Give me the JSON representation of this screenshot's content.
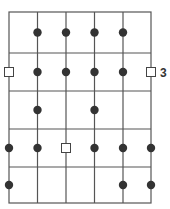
{
  "diagram": {
    "title": "",
    "columns": 6,
    "rows": 5,
    "colors": {
      "line": "#555555",
      "dot": "#333333",
      "square_stroke": "#444444",
      "square_fill": "#ffffff"
    },
    "nodes": [
      {
        "row": 0,
        "col": 1,
        "type": "dot"
      },
      {
        "row": 0,
        "col": 2,
        "type": "dot"
      },
      {
        "row": 0,
        "col": 3,
        "type": "dot"
      },
      {
        "row": 0,
        "col": 4,
        "type": "dot"
      },
      {
        "row": 1,
        "col": 0,
        "type": "square"
      },
      {
        "row": 1,
        "col": 1,
        "type": "dot"
      },
      {
        "row": 1,
        "col": 2,
        "type": "dot"
      },
      {
        "row": 1,
        "col": 3,
        "type": "dot"
      },
      {
        "row": 1,
        "col": 4,
        "type": "dot"
      },
      {
        "row": 1,
        "col": 5,
        "type": "square"
      },
      {
        "row": 2,
        "col": 1,
        "type": "dot"
      },
      {
        "row": 2,
        "col": 3,
        "type": "dot"
      },
      {
        "row": 3,
        "col": 0,
        "type": "dot"
      },
      {
        "row": 3,
        "col": 1,
        "type": "dot"
      },
      {
        "row": 3,
        "col": 2,
        "type": "square"
      },
      {
        "row": 3,
        "col": 3,
        "type": "dot"
      },
      {
        "row": 3,
        "col": 4,
        "type": "dot"
      },
      {
        "row": 3,
        "col": 5,
        "type": "dot"
      },
      {
        "row": 4,
        "col": 0,
        "type": "dot"
      },
      {
        "row": 4,
        "col": 4,
        "type": "dot"
      },
      {
        "row": 4,
        "col": 5,
        "type": "dot"
      }
    ],
    "row_labels": [
      {
        "row": 1,
        "text": "3"
      }
    ]
  }
}
